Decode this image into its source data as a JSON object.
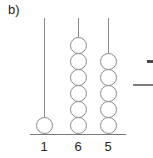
{
  "figure": {
    "label": "b)",
    "background_color": "#ffffff",
    "line_color": "#8a8a8a",
    "bead_fill_color": "#ffffff",
    "text_color": "#262626",
    "baseline": {
      "x": 30,
      "y": 134,
      "width": 96
    },
    "bead_diameter": 17,
    "rods": [
      {
        "name": "rod-1",
        "label": "1",
        "bead_count": 1,
        "x": 44,
        "top_y": 18,
        "bottom_y": 134,
        "label_x": 34,
        "label_y": 140
      },
      {
        "name": "rod-2",
        "label": "6",
        "bead_count": 6,
        "x": 78,
        "top_y": 18,
        "bottom_y": 134,
        "label_x": 68,
        "label_y": 140
      },
      {
        "name": "rod-3",
        "label": "5",
        "bead_count": 5,
        "x": 108,
        "top_y": 18,
        "bottom_y": 134,
        "label_x": 98,
        "label_y": 140
      }
    ],
    "edge_marks": [
      {
        "name": "edge-dash-mark",
        "x": 147,
        "y": 60,
        "width": 6,
        "height": 3
      },
      {
        "name": "edge-rule-mark",
        "x": 133,
        "y": 84,
        "width": 20,
        "height": 2
      }
    ]
  }
}
